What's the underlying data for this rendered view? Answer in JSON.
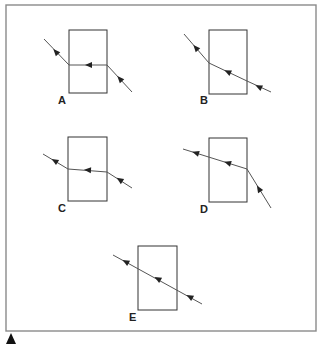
{
  "figure": {
    "frame": {
      "x": 6,
      "y": 5,
      "w": 310,
      "h": 326
    },
    "panels": [
      {
        "label": "A",
        "label_pos": [
          58,
          104
        ],
        "block": {
          "x": 69,
          "y": 30,
          "w": 38,
          "h": 63
        },
        "ray": [
          [
            44,
            39
          ],
          [
            69,
            65
          ],
          [
            107,
            65
          ],
          [
            132,
            92
          ]
        ],
        "arrows": [
          [
            56,
            52,
            -133
          ],
          [
            89,
            65,
            180
          ],
          [
            120,
            79,
            -133
          ]
        ]
      },
      {
        "label": "B",
        "label_pos": [
          200,
          104
        ],
        "block": {
          "x": 209,
          "y": 30,
          "w": 38,
          "h": 64
        },
        "ray": [
          [
            184,
            34
          ],
          [
            209,
            63
          ],
          [
            247,
            81
          ],
          [
            271,
            92
          ]
        ],
        "arrows": [
          [
            196,
            48,
            -131
          ],
          [
            228,
            72,
            -155
          ],
          [
            259,
            87,
            -155
          ]
        ]
      },
      {
        "label": "C",
        "label_pos": [
          58,
          212
        ],
        "block": {
          "x": 68,
          "y": 137,
          "w": 39,
          "h": 64
        },
        "ray": [
          [
            43,
            154
          ],
          [
            68,
            169
          ],
          [
            107,
            172
          ],
          [
            132,
            188
          ]
        ],
        "arrows": [
          [
            55,
            161,
            -149
          ],
          [
            88,
            170,
            -176
          ],
          [
            120,
            180,
            -147
          ]
        ]
      },
      {
        "label": "D",
        "label_pos": [
          200,
          213
        ],
        "block": {
          "x": 209,
          "y": 138,
          "w": 38,
          "h": 64
        },
        "ray": [
          [
            183,
            149
          ],
          [
            247,
            169
          ],
          [
            271,
            208
          ]
        ],
        "arrows": [
          [
            196,
            153,
            -163
          ],
          [
            228,
            163,
            -163
          ],
          [
            259,
            189,
            -122
          ]
        ]
      },
      {
        "label": "E",
        "label_pos": [
          129,
          321
        ],
        "block": {
          "x": 138,
          "y": 246,
          "w": 39,
          "h": 64
        },
        "ray": [
          [
            113,
            255
          ],
          [
            202,
            304
          ]
        ],
        "arrows": [
          [
            126,
            262,
            -151
          ],
          [
            158,
            279,
            -151
          ],
          [
            190,
            297,
            -151
          ]
        ]
      }
    ],
    "corner_marker": "triangle-up"
  }
}
